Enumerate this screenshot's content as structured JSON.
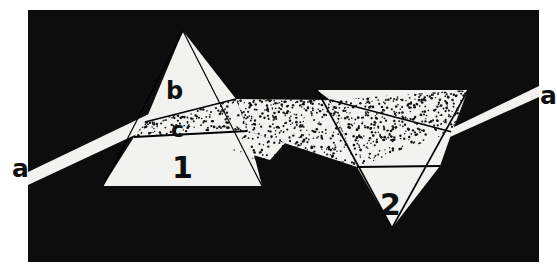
{
  "figure": {
    "type": "optics-ray-diagram",
    "background_color": "#ffffff",
    "frame_color": "#0d0d0d",
    "beam_color": "#f2f2ee",
    "prism_color": "#f2f2ee",
    "outline_color": "#000000",
    "frame": {
      "x": 28,
      "y": 10,
      "width": 511,
      "height": 252
    }
  },
  "labels": {
    "incoming_ray": "a",
    "outgoing_ray": "a",
    "upper_boundary": "b",
    "lower_boundary": "c",
    "prism_one": "1",
    "prism_two": "2"
  },
  "label_positions": {
    "incoming_ray": {
      "x": 12,
      "y": 157
    },
    "outgoing_ray": {
      "x": 540,
      "y": 84
    },
    "upper_boundary": {
      "x": 166,
      "y": 75
    },
    "lower_boundary": {
      "x": 170,
      "y": 115
    },
    "prism_one": {
      "x": 172,
      "y": 145
    },
    "prism_two": {
      "x": 381,
      "y": 190
    }
  },
  "elements": [
    {
      "name": "incoming-white-beam",
      "label": "a",
      "description": "white light beam entering prism 1 from lower left"
    },
    {
      "name": "prism-one",
      "label": "1",
      "description": "upright triangular prism, apex up"
    },
    {
      "name": "boundary-line-b",
      "label": "b",
      "description": "upper edge of dispersed band inside prism 1"
    },
    {
      "name": "boundary-line-c",
      "label": "c",
      "description": "lower edge of dispersed band inside prism 1"
    },
    {
      "name": "dispersed-spectrum-beam",
      "description": "stippled spreading spectrum between the prisms"
    },
    {
      "name": "prism-two",
      "label": "2",
      "description": "inverted triangular prism, apex down"
    },
    {
      "name": "outgoing-white-beam",
      "label": "a",
      "description": "recombined white light beam leaving prism 2 to upper right"
    }
  ],
  "geometry": {
    "prism_one": {
      "apex": [
        183,
        31
      ],
      "base_left": [
        103,
        186
      ],
      "base_right": [
        262,
        186
      ]
    },
    "prism_two": {
      "apex": [
        392,
        228
      ],
      "top_left": [
        317,
        90
      ],
      "top_right": [
        468,
        90
      ]
    },
    "incoming_beam": {
      "from": [
        28,
        180
      ],
      "to": [
        145,
        122
      ]
    },
    "outgoing_beam": {
      "from": [
        452,
        132
      ],
      "to": [
        539,
        92
      ]
    }
  },
  "stipple": {
    "seed": 20240617,
    "density": 0.055,
    "dot_radius": 1.05,
    "color": "#121212"
  }
}
